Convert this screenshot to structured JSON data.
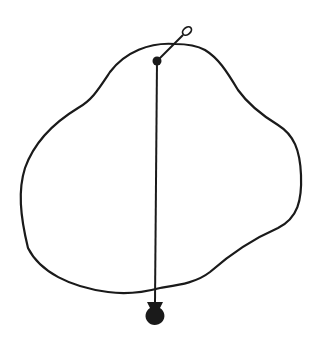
{
  "diagram": {
    "type": "plumb-line-center-of-gravity",
    "stroke_color": "#1a1a1a",
    "background_color": "#ffffff",
    "elements": {
      "outline": "irregular-lamina-shape",
      "pivot": "pin-with-ring-handle",
      "plumb_line": "vertical-string",
      "weight": "plumb-bob"
    }
  }
}
